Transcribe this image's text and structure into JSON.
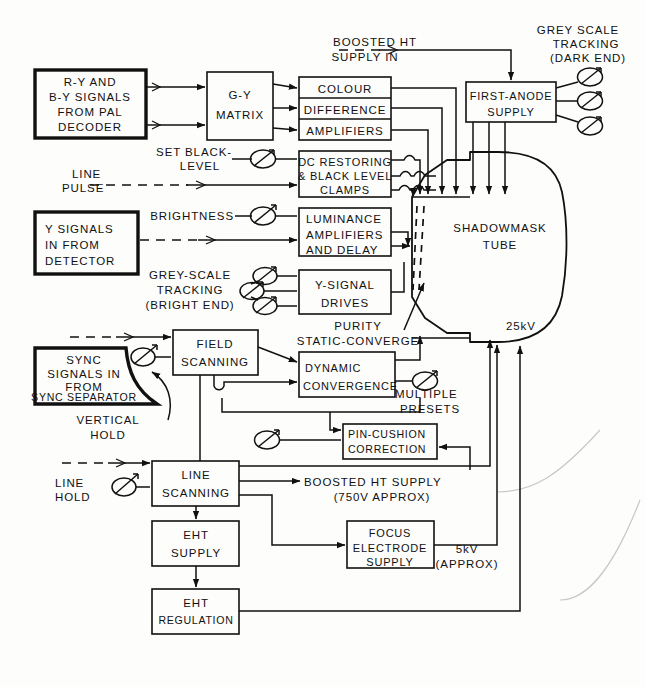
{
  "diagram": {
    "stroke_color": "#111111",
    "background_color": "#fdfdfc"
  },
  "source_blocks": [
    {
      "id": "pal-decoder",
      "lines": [
        "R-Y AND",
        "B-Y SIGNALS",
        "FROM PAL",
        "DECODER"
      ]
    },
    {
      "id": "y-detector",
      "lines": [
        "Y SIGNALS",
        "IN FROM",
        "DETECTOR"
      ]
    },
    {
      "id": "sync-separator",
      "lines": [
        "SYNC",
        "SIGNALS IN",
        "FROM",
        "SYNC SEPARATOR"
      ]
    }
  ],
  "blocks": [
    {
      "id": "g-y-matrix",
      "lines": [
        "G-Y",
        "MATRIX"
      ]
    },
    {
      "id": "colour-difference-amplifiers",
      "lines": [
        "COLOUR",
        "DIFFERENCE",
        "AMPLIFIERS"
      ]
    },
    {
      "id": "dc-restoring",
      "lines": [
        "DC RESTORING",
        "& BLACK LEVEL",
        "CLAMPS"
      ]
    },
    {
      "id": "luminance-amplifiers",
      "lines": [
        "LUMINANCE",
        "AMPLIFIERS",
        "AND DELAY"
      ]
    },
    {
      "id": "y-signal-drives",
      "lines": [
        "Y-SIGNAL",
        "DRIVES"
      ]
    },
    {
      "id": "first-anode-supply",
      "lines": [
        "FIRST-ANODE",
        "SUPPLY"
      ]
    },
    {
      "id": "field-scanning",
      "lines": [
        "FIELD",
        "SCANNING"
      ]
    },
    {
      "id": "dynamic-convergence",
      "lines": [
        "DYNAMIC",
        "CONVERGENCE"
      ]
    },
    {
      "id": "pin-cushion-correction",
      "lines": [
        "PIN-CUSHION",
        "CORRECTION"
      ]
    },
    {
      "id": "line-scanning",
      "lines": [
        "LINE",
        "SCANNING"
      ]
    },
    {
      "id": "eht-supply",
      "lines": [
        "EHT",
        "SUPPLY"
      ]
    },
    {
      "id": "eht-regulation",
      "lines": [
        "EHT",
        "REGULATION"
      ]
    },
    {
      "id": "focus-electrode-supply",
      "lines": [
        "FOCUS",
        "ELECTRODE",
        "SUPPLY"
      ]
    }
  ],
  "tube": {
    "id": "shadowmask-tube",
    "lines": [
      "SHADOWMASK",
      "TUBE"
    ]
  },
  "annotations": [
    {
      "id": "boosted-ht-supply-in",
      "lines": [
        "BOOSTED HT",
        "SUPPLY IN"
      ]
    },
    {
      "id": "grey-scale-tracking-dark",
      "lines": [
        "GREY SCALE",
        "TRACKING",
        "(DARK END)"
      ]
    },
    {
      "id": "set-black-level",
      "lines": [
        "SET BLACK-",
        "LEVEL"
      ]
    },
    {
      "id": "line-pulse",
      "lines": [
        "LINE",
        "PULSE"
      ]
    },
    {
      "id": "brightness",
      "lines": [
        "BRIGHTNESS"
      ]
    },
    {
      "id": "grey-scale-tracking-bright",
      "lines": [
        "GREY-SCALE",
        "TRACKING",
        "(BRIGHT END)"
      ]
    },
    {
      "id": "purity-static-converge",
      "lines": [
        "PURITY",
        "STATIC-CONVERGE"
      ]
    },
    {
      "id": "multiple-presets",
      "lines": [
        "MULTIPLE",
        "PRESETS"
      ]
    },
    {
      "id": "vertical-hold",
      "lines": [
        "VERTICAL",
        "HOLD"
      ]
    },
    {
      "id": "line-hold",
      "lines": [
        "LINE",
        "HOLD"
      ]
    },
    {
      "id": "boosted-ht-supply-out",
      "lines": [
        "BOOSTED HT SUPPLY",
        "(750V APPROX)"
      ]
    },
    {
      "id": "focus-voltage",
      "lines": [
        "5kV",
        "(APPROX)"
      ]
    },
    {
      "id": "eht-voltage",
      "lines": [
        "25kV"
      ]
    }
  ],
  "controls": [
    {
      "id": "grey-scale-dark-pot-1"
    },
    {
      "id": "grey-scale-dark-pot-2"
    },
    {
      "id": "grey-scale-dark-pot-3"
    },
    {
      "id": "set-black-level-pot"
    },
    {
      "id": "brightness-pot"
    },
    {
      "id": "grey-scale-bright-pot-1"
    },
    {
      "id": "grey-scale-bright-pot-2"
    },
    {
      "id": "grey-scale-bright-pot-3"
    },
    {
      "id": "multiple-presets-pot"
    },
    {
      "id": "pin-cushion-pot"
    },
    {
      "id": "vertical-hold-pot"
    },
    {
      "id": "line-hold-pot"
    }
  ]
}
